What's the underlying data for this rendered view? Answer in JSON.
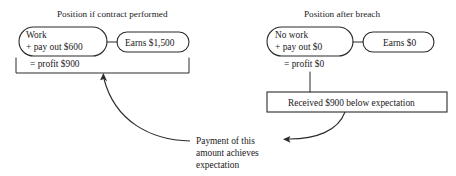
{
  "diagram": {
    "left_panel": {
      "title": "Position if contract performed",
      "outflow_pill": {
        "line1": "Work",
        "line2": "+ pay out $600"
      },
      "inflow_pill": {
        "label": "Earns $1,500"
      },
      "net_result": "= profit $900"
    },
    "right_panel": {
      "title": "Position after breach",
      "outflow_pill": {
        "line1": "No work",
        "line2": "+ pay out $0"
      },
      "inflow_pill": {
        "label": "Earns $0"
      },
      "net_result": "= profit $0",
      "shortfall_box": "Received $900 below expectation"
    },
    "caption": {
      "line1": "Payment of this",
      "line2": "amount achieves",
      "line3": "expectation"
    },
    "colors": {
      "ink": "#2b2b2b",
      "background": "#ffffff"
    }
  }
}
